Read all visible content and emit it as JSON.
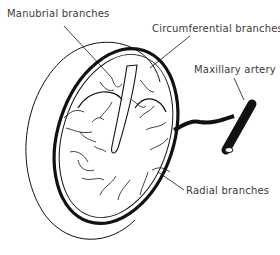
{
  "figure": {
    "labels": {
      "manubrial": "Manubrial branches",
      "circumferential": "Circumferential branches",
      "maxillary": "Maxillary artery",
      "radial": "Radial branches"
    },
    "colors": {
      "ink": "#111111",
      "label": "#3a3a3a",
      "background": "#ffffff"
    }
  }
}
